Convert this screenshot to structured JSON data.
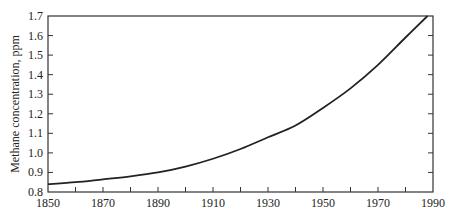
{
  "chart_data": {
    "type": "line",
    "title": "",
    "xlabel": "",
    "ylabel": "Methane concentration, ppm",
    "xlim": [
      1850,
      1990
    ],
    "ylim": [
      0.8,
      1.7
    ],
    "grid": false,
    "legend": null,
    "x_ticks": [
      "1850",
      "1870",
      "1890",
      "1910",
      "1930",
      "1950",
      "1970",
      "1990"
    ],
    "x_minor_step": 10,
    "y_ticks": [
      "0.8",
      "0.9",
      "1.0",
      "1.1",
      "1.2",
      "1.3",
      "1.4",
      "1.5",
      "1.6",
      "1.7"
    ],
    "series": [
      {
        "name": "Methane concentration",
        "color": "#222222",
        "x": [
          1850,
          1860,
          1870,
          1880,
          1890,
          1900,
          1910,
          1920,
          1930,
          1940,
          1950,
          1960,
          1970,
          1980,
          1988
        ],
        "values": [
          0.84,
          0.85,
          0.865,
          0.88,
          0.9,
          0.93,
          0.97,
          1.02,
          1.08,
          1.14,
          1.23,
          1.33,
          1.45,
          1.59,
          1.7
        ]
      }
    ]
  },
  "colors": {
    "axis": "#333333",
    "line": "#222222",
    "background": "#ffffff"
  }
}
